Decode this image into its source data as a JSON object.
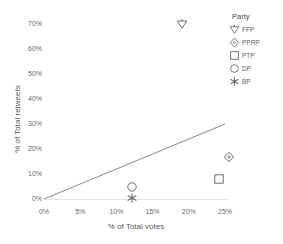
{
  "chart_data": {
    "type": "scatter",
    "title": "",
    "xlabel": "% of Total votes",
    "ylabel": "% of Total retweets",
    "xlim": [
      0,
      27.5
    ],
    "ylim": [
      0,
      75
    ],
    "grid": false,
    "legend_position": "top-right",
    "legend_title": "Party",
    "x_tick_labels": [
      "0%",
      "5%",
      "10%",
      "15%",
      "20%",
      "25%"
    ],
    "x_tick_values": [
      0,
      5,
      10,
      15,
      20,
      25
    ],
    "y_tick_labels": [
      "0%",
      "10%",
      "20%",
      "30%",
      "40%",
      "50%",
      "60%",
      "70%"
    ],
    "y_tick_values": [
      0,
      10,
      20,
      30,
      40,
      50,
      60,
      70
    ],
    "series": [
      {
        "name": "FFP",
        "marker": "triangle-down",
        "points": [
          {
            "x": 19.0,
            "y": 70.0
          }
        ]
      },
      {
        "name": "PPRP",
        "marker": "diamond",
        "points": [
          {
            "x": 25.6,
            "y": 17.0
          }
        ]
      },
      {
        "name": "PTP",
        "marker": "square",
        "points": [
          {
            "x": 24.2,
            "y": 8.0
          }
        ]
      },
      {
        "name": "DP",
        "marker": "circle",
        "points": [
          {
            "x": 12.2,
            "y": 5.0
          }
        ]
      },
      {
        "name": "BP",
        "marker": "star",
        "points": [
          {
            "x": 12.2,
            "y": 0.5
          }
        ]
      }
    ],
    "trendline": {
      "visible": true,
      "x_start": 0.0,
      "y_start": 0.0,
      "x_end": 25.0,
      "y_end": 30.0,
      "color": "#7a7a7a"
    }
  },
  "legend": {
    "title": "Party",
    "items": [
      {
        "label": "FFP",
        "marker": "triangle-down-icon"
      },
      {
        "label": "PPRP",
        "marker": "diamond-icon"
      },
      {
        "label": "PTP",
        "marker": "square-icon"
      },
      {
        "label": "DP",
        "marker": "circle-icon"
      },
      {
        "label": "BP",
        "marker": "star-icon"
      }
    ]
  },
  "axes": {
    "x_title": "% of Total votes",
    "y_title": "% of Total retweets"
  },
  "colors": {
    "marker_stroke": "#6e6e6e",
    "trendline": "#7a7a7a",
    "text": "#5a5a5a",
    "baseline": "#e3e3e3",
    "background": "#ffffff"
  }
}
